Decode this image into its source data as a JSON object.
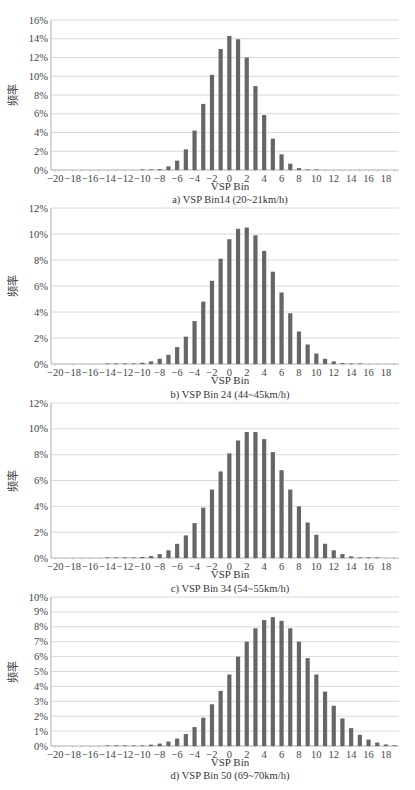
{
  "figure": {
    "y_axis_label": "频率",
    "x_axis_label": "VSP Bin",
    "bar_color": "#666666",
    "grid_color": "#d0d0d0"
  },
  "chart_data": [
    {
      "type": "bar",
      "caption": "a) VSP Bin14 (20~21km/h)",
      "xlabel": "VSP Bin",
      "ylabel": "频率",
      "ylim": [
        0,
        16
      ],
      "yticks": [
        "0%",
        "2%",
        "4%",
        "6%",
        "8%",
        "10%",
        "12%",
        "14%",
        "16%"
      ],
      "ytick_values": [
        0,
        2,
        4,
        6,
        8,
        10,
        12,
        14,
        16
      ],
      "xticks": [
        -20,
        -18,
        -16,
        -14,
        -12,
        -10,
        -8,
        -6,
        -4,
        -2,
        0,
        2,
        4,
        6,
        8,
        10,
        12,
        14,
        16,
        18
      ],
      "grid": true,
      "categories": [
        -20,
        -19,
        -18,
        -17,
        -16,
        -15,
        -14,
        -13,
        -12,
        -11,
        -10,
        -9,
        -8,
        -7,
        -6,
        -5,
        -4,
        -3,
        -2,
        -1,
        0,
        1,
        2,
        3,
        4,
        5,
        6,
        7,
        8,
        9,
        10,
        11,
        12,
        13,
        14,
        15,
        16,
        17,
        18,
        19
      ],
      "values": [
        0,
        0,
        0,
        0,
        0,
        0,
        0,
        0,
        0,
        0,
        0.01,
        0.03,
        0.1,
        0.39,
        1.0,
        2.2,
        4.2,
        7.05,
        10.15,
        12.9,
        14.3,
        13.95,
        12.0,
        8.95,
        5.87,
        3.35,
        1.67,
        0.68,
        0.2,
        0.04,
        0.01,
        0,
        0,
        0,
        0,
        0,
        0,
        0,
        0,
        0
      ]
    },
    {
      "type": "bar",
      "caption": "b) VSP Bin 24 (44~45km/h)",
      "xlabel": "VSP Bin",
      "ylabel": "频率",
      "ylim": [
        0,
        12
      ],
      "yticks": [
        "0%",
        "2%",
        "4%",
        "6%",
        "8%",
        "10%",
        "12%"
      ],
      "ytick_values": [
        0,
        2,
        4,
        6,
        8,
        10,
        12
      ],
      "xticks": [
        -20,
        -18,
        -16,
        -14,
        -12,
        -10,
        -8,
        -6,
        -4,
        -2,
        0,
        2,
        4,
        6,
        8,
        10,
        12,
        14,
        16,
        18
      ],
      "grid": true,
      "categories": [
        -20,
        -19,
        -18,
        -17,
        -16,
        -15,
        -14,
        -13,
        -12,
        -11,
        -10,
        -9,
        -8,
        -7,
        -6,
        -5,
        -4,
        -3,
        -2,
        -1,
        0,
        1,
        2,
        3,
        4,
        5,
        6,
        7,
        8,
        9,
        10,
        11,
        12,
        13,
        14,
        15,
        16,
        17,
        18,
        19
      ],
      "values": [
        0,
        0,
        0,
        0,
        0,
        0,
        0.01,
        0.01,
        0.02,
        0.03,
        0.1,
        0.2,
        0.4,
        0.7,
        1.3,
        2.1,
        3.3,
        4.8,
        6.4,
        8.1,
        9.6,
        10.4,
        10.5,
        9.9,
        8.7,
        7.1,
        5.5,
        3.9,
        2.5,
        1.5,
        0.8,
        0.4,
        0.2,
        0.08,
        0.03,
        0.01,
        0,
        0,
        0,
        0
      ]
    },
    {
      "type": "bar",
      "caption": "c) VSP Bin 34 (54~55km/h)",
      "xlabel": "VSP Bin",
      "ylabel": "频率",
      "ylim": [
        0,
        12
      ],
      "yticks": [
        "0%",
        "2%",
        "4%",
        "6%",
        "8%",
        "10%",
        "12%"
      ],
      "ytick_values": [
        0,
        2,
        4,
        6,
        8,
        10,
        12
      ],
      "xticks": [
        -20,
        -18,
        -16,
        -14,
        -12,
        -10,
        -8,
        -6,
        -4,
        -2,
        0,
        2,
        4,
        6,
        8,
        10,
        12,
        14,
        16,
        18
      ],
      "grid": true,
      "categories": [
        -20,
        -19,
        -18,
        -17,
        -16,
        -15,
        -14,
        -13,
        -12,
        -11,
        -10,
        -9,
        -8,
        -7,
        -6,
        -5,
        -4,
        -3,
        -2,
        -1,
        0,
        1,
        2,
        3,
        4,
        5,
        6,
        7,
        8,
        9,
        10,
        11,
        12,
        13,
        14,
        15,
        16,
        17,
        18,
        19
      ],
      "values": [
        0,
        0,
        0,
        0,
        0,
        0,
        0.01,
        0.01,
        0.02,
        0.04,
        0.08,
        0.15,
        0.3,
        0.6,
        1.1,
        1.75,
        2.7,
        3.9,
        5.3,
        6.7,
        8.1,
        9.1,
        9.75,
        9.75,
        9.2,
        8.2,
        6.8,
        5.3,
        4.0,
        2.75,
        1.8,
        1.1,
        0.6,
        0.3,
        0.13,
        0.05,
        0.02,
        0.01,
        0,
        0
      ]
    },
    {
      "type": "bar",
      "caption": "d) VSP Bin 50 (69~70km/h)",
      "xlabel": "VSP Bin",
      "ylabel": "频率",
      "ylim": [
        0,
        10
      ],
      "yticks": [
        "0%",
        "1%",
        "2%",
        "3%",
        "4%",
        "5%",
        "6%",
        "7%",
        "8%",
        "9%",
        "10%"
      ],
      "ytick_values": [
        0,
        1,
        2,
        3,
        4,
        5,
        6,
        7,
        8,
        9,
        10
      ],
      "xticks": [
        -20,
        -18,
        -16,
        -14,
        -12,
        -10,
        -8,
        -6,
        -4,
        -2,
        0,
        2,
        4,
        6,
        8,
        10,
        12,
        14,
        16,
        18
      ],
      "grid": true,
      "categories": [
        -20,
        -19,
        -18,
        -17,
        -16,
        -15,
        -14,
        -13,
        -12,
        -11,
        -10,
        -9,
        -8,
        -7,
        -6,
        -5,
        -4,
        -3,
        -2,
        -1,
        0,
        1,
        2,
        3,
        4,
        5,
        6,
        7,
        8,
        9,
        10,
        11,
        12,
        13,
        14,
        15,
        16,
        17,
        18,
        19
      ],
      "values": [
        0,
        0,
        0,
        0,
        0,
        0,
        0.01,
        0.01,
        0.01,
        0.02,
        0.04,
        0.09,
        0.16,
        0.3,
        0.5,
        0.8,
        1.27,
        1.9,
        2.8,
        3.7,
        4.8,
        6.0,
        7.0,
        7.9,
        8.45,
        8.65,
        8.4,
        7.9,
        7.0,
        5.9,
        4.8,
        3.65,
        2.7,
        1.85,
        1.2,
        0.75,
        0.43,
        0.23,
        0.1,
        0.05
      ]
    }
  ]
}
